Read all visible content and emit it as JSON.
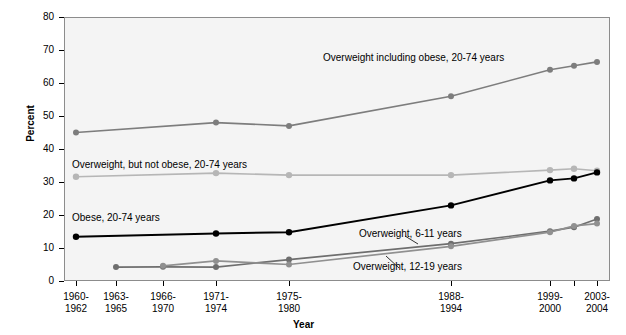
{
  "chart_data": {
    "type": "line",
    "title": "",
    "xlabel": "Year",
    "ylabel": "Percent",
    "ylim": [
      0,
      80
    ],
    "yticks": [
      0,
      10,
      20,
      30,
      40,
      50,
      60,
      70,
      80
    ],
    "grid": false,
    "legend_position": "inline-annotations",
    "categories": [
      "1960-1962",
      "1963-1965",
      "1966-1970",
      "1971-1974",
      "1975-1980",
      "1988-1994",
      "1999-2000",
      "2001-2002",
      "2003-2004"
    ],
    "category_lines": [
      [
        "1960-",
        "1962"
      ],
      [
        "1963-",
        "1965"
      ],
      [
        "1966-",
        "1970"
      ],
      [
        "1971-",
        "1974"
      ],
      [
        "1975-",
        "1980"
      ],
      [
        "1988-",
        "1994"
      ],
      [
        "1999-",
        "2000"
      ],
      [
        "",
        ""
      ],
      [
        "2003-",
        "2004"
      ]
    ],
    "x_positions_px": [
      76,
      116,
      163,
      216,
      289,
      451,
      550,
      574,
      597
    ],
    "tick_labels_shown": [
      "1960-1962",
      "1963-1965",
      "1966-1970",
      "1971-1974",
      "1975-1980",
      "1988-1994",
      "1999-2000",
      "2003-2004"
    ],
    "series": [
      {
        "name": "Overweight including obese, 20-74 years",
        "color": "#7d7d7d",
        "label_text": "Overweight including obese, 20-74 years",
        "x": [
          "1960-1962",
          "1971-1974",
          "1975-1980",
          "1988-1994",
          "1999-2000",
          "2001-2002",
          "2003-2004"
        ],
        "values": [
          45.0,
          48.0,
          47.0,
          56.0,
          64.0,
          65.2,
          66.4
        ]
      },
      {
        "name": "Overweight, but not obese, 20-74 years",
        "color": "#b6b6b6",
        "label_text": "Overweight, but not obese, 20-74 years",
        "x": [
          "1960-1962",
          "1971-1974",
          "1975-1980",
          "1988-1994",
          "1999-2000",
          "2001-2002",
          "2003-2004"
        ],
        "values": [
          31.6,
          32.7,
          32.1,
          32.1,
          33.6,
          34.0,
          33.4
        ]
      },
      {
        "name": "Obese, 20-74 years",
        "color": "#000000",
        "label_text": "Obese, 20-74 years",
        "x": [
          "1960-1962",
          "1971-1974",
          "1975-1980",
          "1988-1994",
          "1999-2000",
          "2001-2002",
          "2003-2004"
        ],
        "values": [
          13.4,
          14.4,
          14.8,
          22.9,
          30.5,
          31.1,
          32.9
        ]
      },
      {
        "name": "Overweight, 6-11 years",
        "color": "#6e6e6e",
        "label_text": "Overweight, 6-11 years",
        "x": [
          "1963-1965",
          "1966-1970",
          "1971-1974",
          "1975-1980",
          "1988-1994",
          "1999-2000",
          "2001-2002",
          "2003-2004"
        ],
        "values": [
          4.2,
          4.3,
          4.2,
          6.5,
          11.3,
          15.1,
          16.3,
          18.8
        ]
      },
      {
        "name": "Overweight, 12-19 years",
        "color": "#909090",
        "label_text": "Overweight, 12-19 years",
        "x": [
          "1966-1970",
          "1971-1974",
          "1975-1980",
          "1988-1994",
          "1999-2000",
          "2001-2002",
          "2003-2004"
        ],
        "values": [
          4.6,
          6.1,
          5.0,
          10.5,
          14.8,
          16.7,
          17.4
        ]
      }
    ]
  }
}
